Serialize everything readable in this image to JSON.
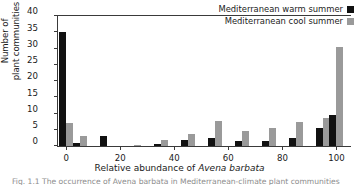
{
  "chart_data": {
    "type": "bar",
    "title": "",
    "xlabel": "Relative abundance of Avena barbata",
    "xlabel_plain": "Relative abundance of ",
    "xlabel_italic": "Avena barbata",
    "ylabel_line1": "Number of",
    "ylabel_line2": "plant communities",
    "xlim": [
      -3,
      105
    ],
    "ylim": [
      0,
      40
    ],
    "xticks": [
      0,
      20,
      40,
      60,
      80,
      100
    ],
    "yticks": [
      0,
      5,
      10,
      15,
      20,
      25,
      30,
      35,
      40
    ],
    "grid": false,
    "legend_position": "top-right",
    "categories": [
      0,
      5,
      15,
      25,
      35,
      45,
      55,
      65,
      75,
      85,
      95,
      100
    ],
    "series": [
      {
        "name": "Mediterranean warm summer",
        "color": "#111111",
        "values": [
          35,
          1,
          3,
          0,
          0.7,
          1.7,
          2.6,
          1.6,
          1.5,
          2.5,
          5.5,
          9.5
        ]
      },
      {
        "name": "Mediterranean cool summer",
        "color": "#9a9a9a",
        "values": [
          7,
          3,
          0,
          0.2,
          1.7,
          3.7,
          7.6,
          4.7,
          5.6,
          7.5,
          8.5,
          30.5
        ]
      }
    ]
  },
  "legend": {
    "items": [
      {
        "label": "Mediterranean warm summer",
        "swatch": "warm"
      },
      {
        "label": "Mediterranean cool summer",
        "swatch": "cool"
      }
    ]
  },
  "caption": {
    "text": "Fig. 1.1  The occurrence of Avena barbata in Mediterranean-climate plant communities"
  }
}
